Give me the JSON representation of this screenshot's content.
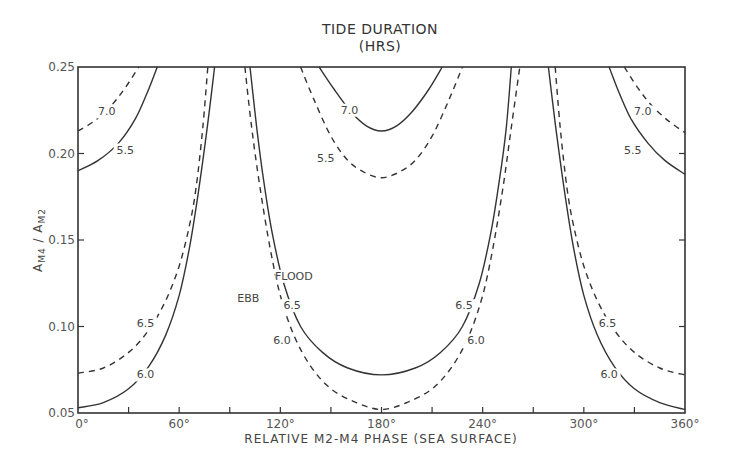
{
  "chart_data": {
    "type": "line",
    "title": "TIDE DURATION",
    "subtitle": "(HRS)",
    "xlabel": "RELATIVE M2-M4 PHASE (SEA SURFACE)",
    "ylabel": "A_M4 / A_M2",
    "xlim": [
      0,
      360
    ],
    "ylim": [
      0.05,
      0.25
    ],
    "x_ticks": [
      0,
      30,
      60,
      90,
      120,
      150,
      180,
      210,
      240,
      270,
      300,
      330,
      360
    ],
    "x_tick_labels": [
      "0°",
      "60°",
      "120°",
      "180°",
      "240°",
      "300°",
      "360°"
    ],
    "x_tick_label_values": [
      0,
      60,
      120,
      180,
      240,
      300,
      360
    ],
    "y_ticks": [
      0.05,
      0.1,
      0.15,
      0.2,
      0.25
    ],
    "y_tick_labels": [
      "0.05",
      "0.10",
      "0.15",
      "0.20",
      "0.25"
    ],
    "grid": false,
    "legend_annotations": [
      {
        "text": "FLOOD",
        "style": "solid",
        "note": "solid lines = flood duration"
      },
      {
        "text": "EBB",
        "style": "dashed",
        "note": "dashed lines = ebb duration"
      }
    ],
    "series": [
      {
        "name": "Ebb 7.0 (left)",
        "style": "dashed",
        "label": "7.0",
        "points": [
          [
            0,
            0.213
          ],
          [
            10,
            0.219
          ],
          [
            20,
            0.228
          ],
          [
            28,
            0.238
          ],
          [
            36,
            0.25
          ]
        ]
      },
      {
        "name": "Flood 5.5 (left)",
        "style": "solid",
        "label": "5.5",
        "points": [
          [
            0,
            0.19
          ],
          [
            12,
            0.196
          ],
          [
            24,
            0.206
          ],
          [
            34,
            0.22
          ],
          [
            41,
            0.235
          ],
          [
            47,
            0.25
          ]
        ]
      },
      {
        "name": "Ebb 6.5 (left)",
        "style": "dashed",
        "label": "6.5",
        "points": [
          [
            0,
            0.073
          ],
          [
            15,
            0.076
          ],
          [
            30,
            0.085
          ],
          [
            42,
            0.098
          ],
          [
            52,
            0.115
          ],
          [
            60,
            0.135
          ],
          [
            66,
            0.158
          ],
          [
            70,
            0.18
          ],
          [
            74,
            0.215
          ],
          [
            77,
            0.25
          ]
        ]
      },
      {
        "name": "Flood 6.0 (left)",
        "style": "solid",
        "label": "6.0",
        "points": [
          [
            0,
            0.053
          ],
          [
            15,
            0.056
          ],
          [
            30,
            0.064
          ],
          [
            42,
            0.077
          ],
          [
            52,
            0.095
          ],
          [
            60,
            0.118
          ],
          [
            66,
            0.145
          ],
          [
            71,
            0.175
          ],
          [
            76,
            0.21
          ],
          [
            81,
            0.25
          ]
        ]
      },
      {
        "name": "Flood 7.0 (center)",
        "style": "solid",
        "label": "7.0",
        "points": [
          [
            143,
            0.25
          ],
          [
            152,
            0.237
          ],
          [
            162,
            0.224
          ],
          [
            171,
            0.216
          ],
          [
            180,
            0.213
          ],
          [
            189,
            0.216
          ],
          [
            198,
            0.224
          ],
          [
            208,
            0.237
          ],
          [
            216,
            0.25
          ]
        ]
      },
      {
        "name": "Ebb 5.5 (center)",
        "style": "dashed",
        "label": "5.5",
        "points": [
          [
            132,
            0.25
          ],
          [
            140,
            0.231
          ],
          [
            150,
            0.21
          ],
          [
            160,
            0.196
          ],
          [
            170,
            0.189
          ],
          [
            180,
            0.186
          ],
          [
            190,
            0.189
          ],
          [
            200,
            0.196
          ],
          [
            210,
            0.21
          ],
          [
            220,
            0.231
          ],
          [
            228,
            0.25
          ]
        ]
      },
      {
        "name": "Flood 6.5 (center)",
        "style": "solid",
        "label": "6.5",
        "points": [
          [
            102,
            0.25
          ],
          [
            106,
            0.215
          ],
          [
            110,
            0.185
          ],
          [
            115,
            0.155
          ],
          [
            122,
            0.125
          ],
          [
            132,
            0.1
          ],
          [
            145,
            0.085
          ],
          [
            160,
            0.076
          ],
          [
            180,
            0.072
          ],
          [
            200,
            0.076
          ],
          [
            215,
            0.085
          ],
          [
            228,
            0.1
          ],
          [
            238,
            0.125
          ],
          [
            245,
            0.155
          ],
          [
            250,
            0.185
          ],
          [
            254,
            0.215
          ],
          [
            257,
            0.25
          ]
        ]
      },
      {
        "name": "Ebb 6.0 (center)",
        "style": "dashed",
        "label": "6.0",
        "points": [
          [
            99,
            0.25
          ],
          [
            103,
            0.215
          ],
          [
            108,
            0.18
          ],
          [
            114,
            0.145
          ],
          [
            120,
            0.118
          ],
          [
            128,
            0.095
          ],
          [
            138,
            0.077
          ],
          [
            150,
            0.064
          ],
          [
            165,
            0.056
          ],
          [
            180,
            0.052
          ],
          [
            195,
            0.056
          ],
          [
            210,
            0.064
          ],
          [
            222,
            0.077
          ],
          [
            232,
            0.095
          ],
          [
            240,
            0.118
          ],
          [
            246,
            0.145
          ],
          [
            252,
            0.18
          ],
          [
            257,
            0.215
          ],
          [
            262,
            0.25
          ]
        ]
      },
      {
        "name": "Flood 6.0 (right)",
        "style": "solid",
        "label": "6.0",
        "points": [
          [
            279,
            0.25
          ],
          [
            284,
            0.21
          ],
          [
            289,
            0.175
          ],
          [
            294,
            0.145
          ],
          [
            300,
            0.118
          ],
          [
            308,
            0.095
          ],
          [
            318,
            0.077
          ],
          [
            330,
            0.064
          ],
          [
            345,
            0.056
          ],
          [
            360,
            0.052
          ]
        ]
      },
      {
        "name": "Ebb 6.5 (right)",
        "style": "dashed",
        "label": "6.5",
        "points": [
          [
            283,
            0.25
          ],
          [
            286,
            0.215
          ],
          [
            290,
            0.18
          ],
          [
            294,
            0.158
          ],
          [
            300,
            0.135
          ],
          [
            308,
            0.115
          ],
          [
            318,
            0.098
          ],
          [
            330,
            0.085
          ],
          [
            345,
            0.076
          ],
          [
            360,
            0.072
          ]
        ]
      },
      {
        "name": "Flood 5.5 (right)",
        "style": "solid",
        "label": "5.5",
        "points": [
          [
            315,
            0.25
          ],
          [
            321,
            0.235
          ],
          [
            328,
            0.22
          ],
          [
            338,
            0.206
          ],
          [
            348,
            0.196
          ],
          [
            360,
            0.188
          ]
        ]
      },
      {
        "name": "Ebb 7.0 (right)",
        "style": "dashed",
        "label": "7.0",
        "points": [
          [
            324,
            0.25
          ],
          [
            332,
            0.238
          ],
          [
            340,
            0.228
          ],
          [
            350,
            0.219
          ],
          [
            360,
            0.212
          ]
        ]
      }
    ],
    "curve_labels": [
      {
        "text": "7.0",
        "x": 17,
        "y": 0.222
      },
      {
        "text": "5.5",
        "x": 28,
        "y": 0.2
      },
      {
        "text": "6.5",
        "x": 40,
        "y": 0.1
      },
      {
        "text": "6.0",
        "x": 40,
        "y": 0.07
      },
      {
        "text": "7.0",
        "x": 161,
        "y": 0.223
      },
      {
        "text": "5.5",
        "x": 147,
        "y": 0.195
      },
      {
        "text": "FLOOD",
        "x": 128,
        "y": 0.127
      },
      {
        "text": "EBB",
        "x": 101,
        "y": 0.114
      },
      {
        "text": "6.5",
        "x": 127,
        "y": 0.11
      },
      {
        "text": "6.0",
        "x": 121,
        "y": 0.09
      },
      {
        "text": "6.5",
        "x": 229,
        "y": 0.11
      },
      {
        "text": "6.0",
        "x": 236,
        "y": 0.09
      },
      {
        "text": "6.5",
        "x": 314,
        "y": 0.1
      },
      {
        "text": "6.0",
        "x": 315,
        "y": 0.07
      },
      {
        "text": "7.0",
        "x": 335,
        "y": 0.222
      },
      {
        "text": "5.5",
        "x": 329,
        "y": 0.2
      }
    ]
  },
  "plot_area": {
    "left": 78,
    "top": 67,
    "right": 685,
    "bottom": 413
  }
}
